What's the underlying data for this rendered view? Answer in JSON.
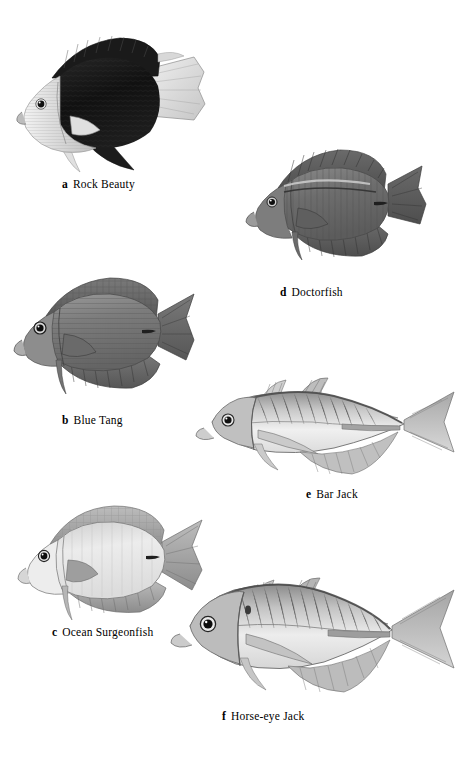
{
  "plate": {
    "width": 468,
    "height": 762,
    "background": "#ffffff",
    "kind": "scientific-illustration-plate",
    "subject": "Caribbean reef fishes",
    "style": "grayscale stipple engraving"
  },
  "figures": [
    {
      "key": "a",
      "letter": "a",
      "name": "Rock Beauty",
      "caption_x": 62,
      "caption_y": 178,
      "body_x": 8,
      "body_y": 24,
      "body_w": 200,
      "body_h": 148,
      "shape": "deep-disc-angelfish",
      "tone_body": "#171717",
      "tone_head": "#dcdcdc",
      "tone_fin": "#e8e8e8"
    },
    {
      "key": "b",
      "letter": "b",
      "name": "Blue Tang",
      "caption_x": 62,
      "caption_y": 414,
      "body_x": 10,
      "body_y": 268,
      "body_w": 188,
      "body_h": 130,
      "shape": "oval-tang",
      "tone_body": "#787878",
      "tone_head": "#8a8a8a",
      "tone_fin": "#6a6a6a"
    },
    {
      "key": "c",
      "letter": "c",
      "name": "Ocean Surgeonfish",
      "caption_x": 52,
      "caption_y": 626,
      "body_x": 10,
      "body_y": 498,
      "body_w": 196,
      "body_h": 124,
      "shape": "oval-tang",
      "tone_body": "#e2e2e2",
      "tone_head": "#ededed",
      "tone_fin": "#9a9a9a"
    },
    {
      "key": "d",
      "letter": "d",
      "name": "Doctorfish",
      "caption_x": 280,
      "caption_y": 286,
      "body_x": 236,
      "body_y": 140,
      "body_w": 196,
      "body_h": 118,
      "shape": "oval-tang",
      "tone_body": "#6e6e6e",
      "tone_head": "#808080",
      "tone_fin": "#585858"
    },
    {
      "key": "e",
      "letter": "e",
      "name": "Bar Jack",
      "caption_x": 306,
      "caption_y": 488,
      "body_x": 192,
      "body_y": 374,
      "body_w": 272,
      "body_h": 100,
      "shape": "streamlined-jack",
      "tone_body": "#d8d8d8",
      "tone_head": "#cfcfcf",
      "tone_fin": "#8c8c8c"
    },
    {
      "key": "f",
      "letter": "f",
      "name": "Horse-eye Jack",
      "caption_x": 222,
      "caption_y": 710,
      "body_x": 168,
      "body_y": 572,
      "body_w": 296,
      "body_h": 124,
      "shape": "deep-jack",
      "tone_body": "#d4d4d4",
      "tone_head": "#c8c8c8",
      "tone_fin": "#8a8a8a"
    }
  ]
}
